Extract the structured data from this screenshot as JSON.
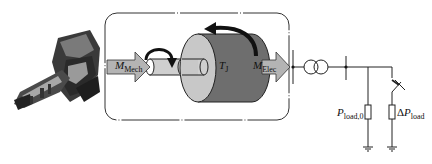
{
  "diagram": {
    "type": "power-system-single-line",
    "components": {
      "turbine": {
        "label": "",
        "icon": "turbine-machine-image"
      },
      "rotor_box": {
        "style": "rounded dash-dot frame"
      },
      "mech_torque": {
        "symbol": "M",
        "subscript": "Mech"
      },
      "elec_torque": {
        "symbol": "M",
        "subscript": "Elec"
      },
      "inertia": {
        "symbol": "T",
        "subscript": "J"
      },
      "transformer": {
        "icon": "two-winding-transformer-icon"
      },
      "load_base": {
        "symbol": "P",
        "subscript": "load,0"
      },
      "load_step": {
        "prefix": "Δ",
        "symbol": "P",
        "subscript": "load"
      },
      "breaker": {
        "icon": "breaker-switch-icon"
      },
      "grounds": 2
    },
    "colors": {
      "arrow_fill": "#b4b4b4",
      "cylinder_face": "#c8c8c8",
      "cylinder_body": "#6e6e6e",
      "shaft": "#cfcfcf",
      "line": "#222222",
      "frame": "#333333"
    }
  }
}
